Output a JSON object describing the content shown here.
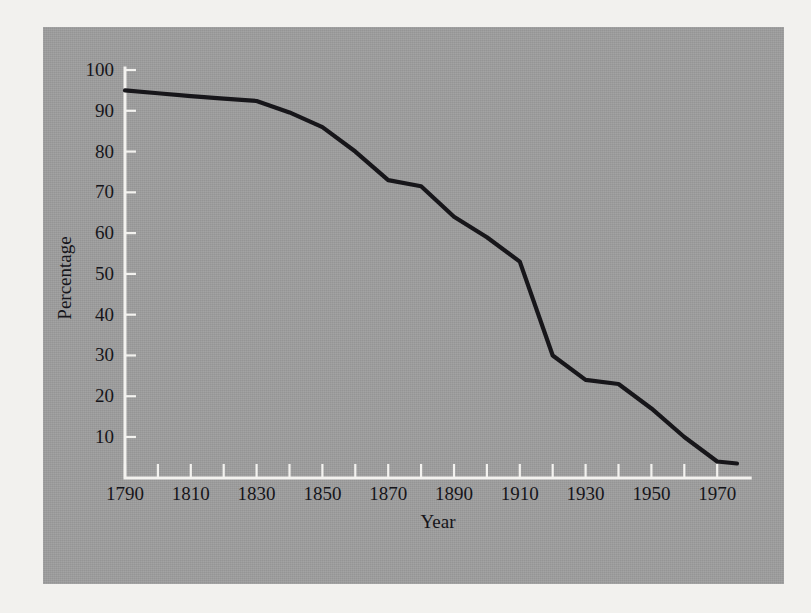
{
  "figure": {
    "panel_background_color": "#9e9e9e",
    "page_background_color": "#f2f1ee",
    "axis_color": "#f3f2ef",
    "line_color": "#17161a",
    "text_color": "#16151a"
  },
  "chart_data": {
    "type": "line",
    "title": "",
    "subtitle": "",
    "xlabel": "Year",
    "ylabel": "Percentage",
    "xlim": [
      1790,
      1977
    ],
    "ylim": [
      0,
      100
    ],
    "grid": false,
    "legend": null,
    "legend_position": "none",
    "x_tick_labels": [
      "1790",
      "1810",
      "1830",
      "1850",
      "1870",
      "1890",
      "1910",
      "1930",
      "1950",
      "1970"
    ],
    "x_tick_values": [
      1790,
      1810,
      1830,
      1850,
      1870,
      1890,
      1910,
      1930,
      1950,
      1970
    ],
    "x_minor_tick_values": [
      1800,
      1820,
      1840,
      1860,
      1880,
      1900,
      1920,
      1940,
      1960
    ],
    "y_tick_labels": [
      "10",
      "20",
      "30",
      "40",
      "50",
      "60",
      "70",
      "80",
      "90",
      "100"
    ],
    "y_tick_values": [
      10,
      20,
      30,
      40,
      50,
      60,
      70,
      80,
      90,
      100
    ],
    "series": [
      {
        "name": "Percentage",
        "x": [
          1790,
          1800,
          1810,
          1820,
          1830,
          1840,
          1850,
          1860,
          1870,
          1880,
          1890,
          1900,
          1910,
          1920,
          1930,
          1940,
          1950,
          1960,
          1970,
          1976
        ],
        "values": [
          95,
          94.3,
          93.6,
          93,
          92.4,
          89.6,
          86,
          80,
          73,
          71.5,
          64,
          59,
          53,
          30,
          24,
          23,
          17,
          10,
          4,
          3.5
        ]
      }
    ]
  }
}
